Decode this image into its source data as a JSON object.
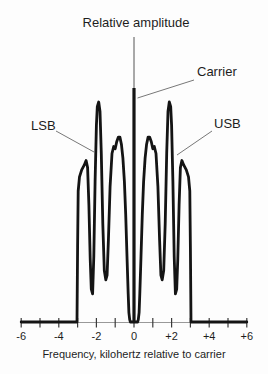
{
  "figure": {
    "kind": "AM signal spectrum diagram"
  },
  "chart_data": {
    "type": "line",
    "title": "Relative amplitude",
    "xlabel": "Frequency, kilohertz relative to carrier",
    "ylabel": "Relative amplitude",
    "xlim": [
      -6,
      6
    ],
    "ylim": [
      0,
      1
    ],
    "grid": false,
    "legend": "none",
    "annotations": {
      "carrier": "Carrier",
      "lsb": "LSB",
      "usb": "USB"
    },
    "x_ticks": [
      {
        "value": -6,
        "label": "-6"
      },
      {
        "value": -5,
        "label": ""
      },
      {
        "value": -4,
        "label": "-4"
      },
      {
        "value": -3,
        "label": ""
      },
      {
        "value": -2,
        "label": "-2"
      },
      {
        "value": -1,
        "label": ""
      },
      {
        "value": 0,
        "label": "0"
      },
      {
        "value": 1,
        "label": ""
      },
      {
        "value": 2,
        "label": "+2"
      },
      {
        "value": 3,
        "label": ""
      },
      {
        "value": 4,
        "label": "+4"
      },
      {
        "value": 5,
        "label": ""
      },
      {
        "value": 6,
        "label": "+6"
      }
    ],
    "series": [
      {
        "name": "sideband-envelope",
        "points": [
          [
            -6,
            0
          ],
          [
            -3.03,
            0
          ],
          [
            -3.0,
            0.32
          ],
          [
            -2.97,
            0.56
          ],
          [
            -2.9,
            0.62
          ],
          [
            -2.78,
            0.65
          ],
          [
            -2.65,
            0.67
          ],
          [
            -2.55,
            0.69
          ],
          [
            -2.47,
            0.66
          ],
          [
            -2.4,
            0.5
          ],
          [
            -2.33,
            0.27
          ],
          [
            -2.27,
            0.14
          ],
          [
            -2.2,
            0.12
          ],
          [
            -2.14,
            0.28
          ],
          [
            -2.07,
            0.6
          ],
          [
            -2.0,
            0.84
          ],
          [
            -1.95,
            0.92
          ],
          [
            -1.88,
            0.94
          ],
          [
            -1.81,
            0.9
          ],
          [
            -1.74,
            0.72
          ],
          [
            -1.66,
            0.42
          ],
          [
            -1.58,
            0.22
          ],
          [
            -1.5,
            0.18
          ],
          [
            -1.43,
            0.2
          ],
          [
            -1.36,
            0.35
          ],
          [
            -1.27,
            0.58
          ],
          [
            -1.17,
            0.72
          ],
          [
            -1.08,
            0.75
          ],
          [
            -1.0,
            0.74
          ],
          [
            -0.92,
            0.77
          ],
          [
            -0.83,
            0.79
          ],
          [
            -0.75,
            0.79
          ],
          [
            -0.67,
            0.76
          ],
          [
            -0.59,
            0.7
          ],
          [
            -0.51,
            0.6
          ],
          [
            -0.44,
            0.46
          ],
          [
            -0.37,
            0.28
          ],
          [
            -0.31,
            0.12
          ],
          [
            -0.27,
            0.04
          ],
          [
            -0.23,
            0.01
          ],
          [
            -0.19,
            0
          ],
          [
            0.19,
            0
          ],
          [
            0.23,
            0.01
          ],
          [
            0.27,
            0.04
          ],
          [
            0.31,
            0.12
          ],
          [
            0.37,
            0.28
          ],
          [
            0.44,
            0.46
          ],
          [
            0.51,
            0.6
          ],
          [
            0.59,
            0.7
          ],
          [
            0.67,
            0.76
          ],
          [
            0.75,
            0.79
          ],
          [
            0.83,
            0.79
          ],
          [
            0.92,
            0.77
          ],
          [
            1.0,
            0.74
          ],
          [
            1.08,
            0.75
          ],
          [
            1.17,
            0.72
          ],
          [
            1.27,
            0.58
          ],
          [
            1.36,
            0.35
          ],
          [
            1.43,
            0.2
          ],
          [
            1.5,
            0.18
          ],
          [
            1.58,
            0.22
          ],
          [
            1.66,
            0.42
          ],
          [
            1.74,
            0.72
          ],
          [
            1.81,
            0.9
          ],
          [
            1.88,
            0.94
          ],
          [
            1.95,
            0.92
          ],
          [
            2.0,
            0.84
          ],
          [
            2.07,
            0.6
          ],
          [
            2.14,
            0.28
          ],
          [
            2.2,
            0.12
          ],
          [
            2.27,
            0.14
          ],
          [
            2.33,
            0.27
          ],
          [
            2.4,
            0.5
          ],
          [
            2.47,
            0.66
          ],
          [
            2.55,
            0.69
          ],
          [
            2.65,
            0.67
          ],
          [
            2.78,
            0.65
          ],
          [
            2.9,
            0.62
          ],
          [
            2.97,
            0.56
          ],
          [
            3.0,
            0.32
          ],
          [
            3.03,
            0
          ],
          [
            6,
            0
          ]
        ]
      },
      {
        "name": "carrier-spike",
        "points": [
          [
            0,
            0
          ],
          [
            0,
            1.0
          ]
        ]
      }
    ]
  },
  "colors": {
    "curve": "#141414",
    "axis_line": "#999999",
    "tick": "#3a3a3a",
    "leader": "#787878",
    "yaxis_line": "#555555",
    "text": "#1d1d1d",
    "background": "#fdfdfd"
  }
}
